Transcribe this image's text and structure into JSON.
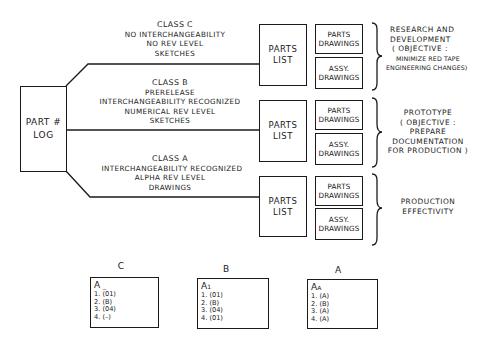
{
  "part_log": {
    "line1": "PART #",
    "line2": "LOG"
  },
  "classes": [
    {
      "lines": [
        "CLASS C",
        "NO INTERCHANGEABILITY",
        "NO REV LEVEL",
        "SKETCHES"
      ],
      "parts_list": [
        "PARTS",
        "LIST"
      ],
      "drawings": [
        [
          "PARTS",
          "DRAWINGS"
        ],
        [
          "ASSY.",
          "DRAWINGS"
        ]
      ],
      "phase": [
        "RESEARCH AND",
        "DEVELOPMENT",
        "( OBJECTIVE :",
        "MINIMIZE RED TAPE",
        "ENGINEERING CHANGES)"
      ]
    },
    {
      "lines": [
        "CLASS B",
        "PRERELEASE",
        "INTERCHANGEABILITY RECOGNIZED",
        "NUMERICAL REV LEVEL",
        "SKETCHES"
      ],
      "parts_list": [
        "PARTS",
        "LIST"
      ],
      "drawings": [
        [
          "PARTS",
          "DRAWINGS"
        ],
        [
          "ASSY.",
          "DRAWINGS"
        ]
      ],
      "phase": [
        "PROTOTYPE",
        "( OBJECTIVE :",
        "PREPARE",
        "DOCUMENTATION",
        "FOR PRODUCTION )"
      ]
    },
    {
      "lines": [
        "CLASS A",
        "INTERCHANGEABILITY RECOGNIZED",
        "ALPHA REV LEVEL",
        "DRAWINGS"
      ],
      "parts_list": [
        "PARTS",
        "LIST"
      ],
      "drawings": [
        [
          "PARTS",
          "DRAWINGS"
        ],
        [
          "ASSY.",
          "DRAWINGS"
        ]
      ],
      "phase": [
        "PRODUCTION",
        "EFFECTIVITY"
      ]
    }
  ],
  "revision_examples": [
    {
      "label": "C",
      "head": "A",
      "sub": "_",
      "rows": [
        "1. (01)",
        "2. (B)",
        "3. (04)",
        "4. (–)"
      ]
    },
    {
      "label": "B",
      "head": "A",
      "sub": "1",
      "rows": [
        "1. (01)",
        "2. (B)",
        "3. (04)",
        "4. (01)"
      ]
    },
    {
      "label": "A",
      "head": "A",
      "sub": "A",
      "rows": [
        "1.  (A)",
        "2.  (B)",
        "3.  (A)",
        "4.  (A)"
      ]
    }
  ],
  "colors": {
    "ink": "#1a1a1a",
    "paper": "#ffffff"
  }
}
